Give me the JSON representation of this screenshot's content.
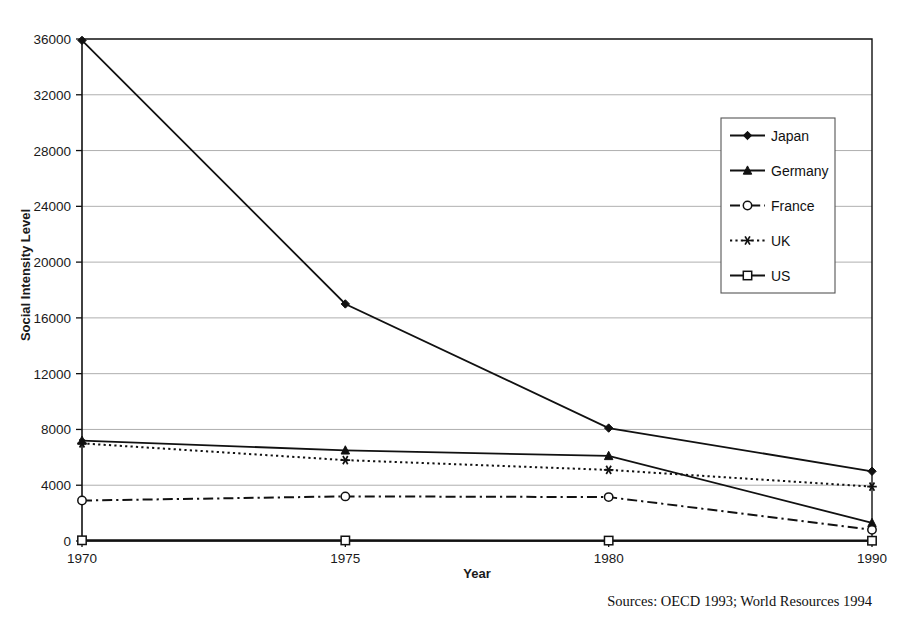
{
  "chart_data": {
    "type": "line",
    "title": "",
    "xlabel": "Year",
    "ylabel": "Social Intensity Level",
    "categories": [
      "1970",
      "1975",
      "1980",
      "1990"
    ],
    "x_tick_labels": [
      "1970",
      "1975",
      "1980",
      "1990"
    ],
    "y_tick_labels": [
      "0",
      "4000",
      "8000",
      "12000",
      "16000",
      "20000",
      "24000",
      "28000",
      "32000",
      "36000"
    ],
    "y_ticks": [
      0,
      4000,
      8000,
      12000,
      16000,
      20000,
      24000,
      28000,
      32000,
      36000
    ],
    "ylim": [
      0,
      36000
    ],
    "grid": "horizontal",
    "legend_position": "upper-right-inside",
    "series": [
      {
        "name": "Japan",
        "marker": "filled-diamond",
        "linestyle": "solid",
        "values": [
          35900,
          17000,
          8100,
          5000
        ]
      },
      {
        "name": "Germany",
        "marker": "filled-triangle",
        "linestyle": "solid",
        "values": [
          7200,
          6500,
          6100,
          1300
        ]
      },
      {
        "name": "France",
        "marker": "open-circle",
        "linestyle": "dash-dot",
        "values": [
          2900,
          3200,
          3150,
          800
        ]
      },
      {
        "name": "UK",
        "marker": "star",
        "linestyle": "dotted",
        "values": [
          7000,
          5800,
          5100,
          3900
        ]
      },
      {
        "name": "US",
        "marker": "open-square",
        "linestyle": "solid",
        "values": [
          50,
          40,
          30,
          20
        ]
      }
    ],
    "annotations": [
      "Sources: OECD 1993; World Resources 1994"
    ]
  },
  "figure": {
    "source_note": "Sources: OECD 1993; World Resources 1994",
    "axis_title_y": "Social Intensity Level",
    "axis_title_x": "Year"
  },
  "legend": {
    "entries": [
      {
        "label": "Japan"
      },
      {
        "label": "Germany"
      },
      {
        "label": "France"
      },
      {
        "label": "UK"
      },
      {
        "label": "US"
      }
    ]
  }
}
